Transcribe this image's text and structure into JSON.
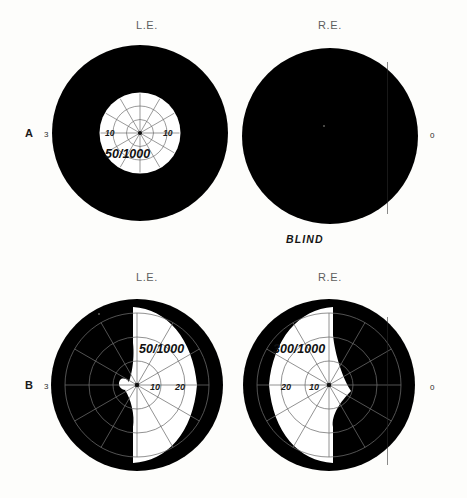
{
  "figure": {
    "kind": "visual-field-perimetry-charts",
    "background_color": "#fdfdfb",
    "field_fill_color": "#ffffff",
    "scotoma_fill_color": "#000000",
    "grid_line_color": "#6e6e6e"
  },
  "panels": [
    {
      "id": "A",
      "letter": "A",
      "left_edge_label": "3",
      "right_edge_label": "0",
      "footnote": "BLIND",
      "eyes": [
        {
          "id": "A-LE",
          "header": "L.E.",
          "side": "left",
          "target_label": "50/1000",
          "ring_labels": [
            "10",
            "10"
          ],
          "ring_degrees": [
            10,
            20
          ],
          "field_shape": "central-island",
          "seeing_radius_deg": 23,
          "description": "severely constricted central island of vision"
        },
        {
          "id": "A-RE",
          "header": "R.E.",
          "side": "right",
          "target_label": "",
          "ring_labels": [],
          "ring_degrees": [],
          "field_shape": "no-light-perception",
          "seeing_radius_deg": 0,
          "description": "entire field black, no seeing area"
        }
      ]
    },
    {
      "id": "B",
      "letter": "B",
      "left_edge_label": "3",
      "right_edge_label": "0",
      "footnote": "",
      "eyes": [
        {
          "id": "B-LE",
          "header": "L.E.",
          "side": "left",
          "target_label": "50/1000",
          "ring_labels": [
            "10",
            "20"
          ],
          "ring_degrees": [
            10,
            20
          ],
          "field_shape": "temporal-crescent-retained",
          "seeing_radius_deg": 30,
          "description": "seeing field occupies the inner/right half of the chart"
        },
        {
          "id": "B-RE",
          "header": "R.E.",
          "side": "right",
          "target_label": "300/1000",
          "ring_labels": [
            "20",
            "10"
          ],
          "ring_degrees": [
            20,
            10
          ],
          "field_shape": "temporal-crescent-retained",
          "seeing_radius_deg": 30,
          "description": "seeing field occupies the inner/left half of the chart"
        }
      ]
    }
  ],
  "grid": {
    "meridian_count": 12,
    "meridian_step_deg": 30,
    "arc_count": 3
  }
}
